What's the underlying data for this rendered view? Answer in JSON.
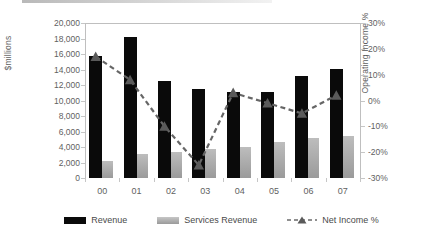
{
  "chart_data": {
    "type": "bar",
    "title": "",
    "subtitle": "",
    "xlabel": "",
    "ylabel": "$millions",
    "y2label": "Operating Income %",
    "grid": false,
    "legend_position": "bottom",
    "categories": [
      "00",
      "01",
      "02",
      "03",
      "04",
      "05",
      "06",
      "07"
    ],
    "ylim": [
      0,
      20000
    ],
    "yticks": [
      0,
      2000,
      4000,
      6000,
      8000,
      10000,
      12000,
      14000,
      16000,
      18000,
      20000
    ],
    "ytick_labels": [
      "0",
      "2,000",
      "4,000",
      "6,000",
      "8,000",
      "10,000",
      "12,000",
      "14,000",
      "16,000",
      "18,000",
      "20,000"
    ],
    "y2lim": [
      -30,
      30
    ],
    "y2ticks": [
      -30,
      -20,
      -10,
      0,
      10,
      20,
      30
    ],
    "y2tick_labels": [
      "-30%",
      "-20%",
      "-10%",
      "0%",
      "10%",
      "20%",
      "30%"
    ],
    "series": [
      {
        "name": "Revenue",
        "type": "bar",
        "axis": "left",
        "color": "#0a0a0a",
        "values": [
          15750,
          18250,
          12550,
          11450,
          11150,
          11150,
          13200,
          14100
        ]
      },
      {
        "name": "Services Revenue",
        "type": "bar",
        "axis": "left",
        "color": "#a8a8a8",
        "values": [
          2250,
          3150,
          3300,
          3750,
          3950,
          4700,
          5150,
          5400
        ]
      },
      {
        "name": "Net Income %",
        "type": "line",
        "axis": "right",
        "color": "#666666",
        "marker": "triangle",
        "linestyle": "dashed",
        "values": [
          17,
          8,
          -10,
          -25,
          3,
          -1,
          -5,
          2
        ]
      }
    ]
  },
  "legend": {
    "items": [
      {
        "label": "Revenue",
        "marker": "filled-rect-black"
      },
      {
        "label": "Services Revenue",
        "marker": "filled-rect-gray"
      },
      {
        "label": "Net Income %",
        "marker": "dashed-line-triangle"
      }
    ]
  },
  "axes": {
    "left_title": "$millions",
    "right_title": "Operating Income %"
  }
}
